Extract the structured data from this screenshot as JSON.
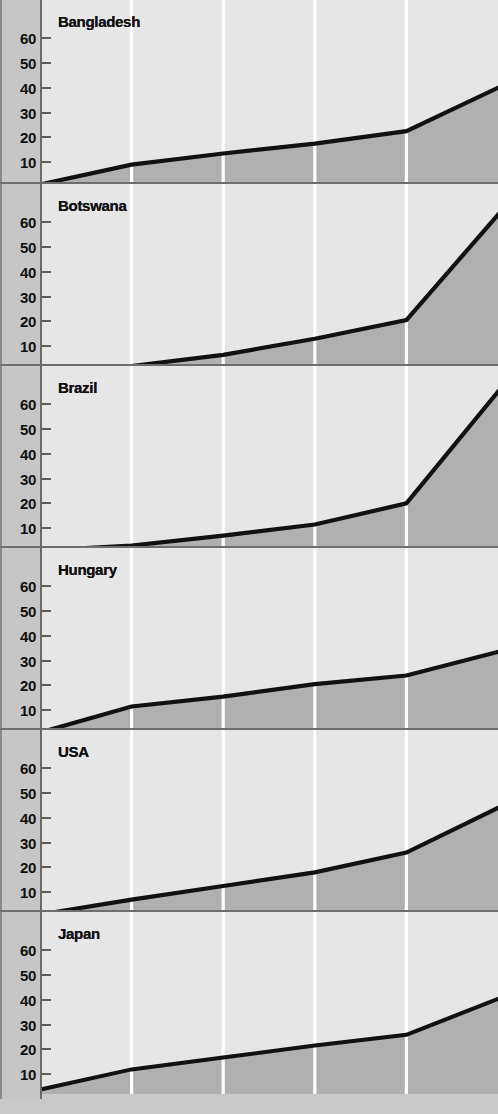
{
  "figure": {
    "kind": "small-multiples-area-chart",
    "panel_count": 6,
    "colors": {
      "gutter": "#c6c6c6",
      "area_above_line": "#e6e6e6",
      "area_below_line": "#b0b0b0",
      "line": "#111111",
      "gridline": "#ffffff",
      "axis": "#6a6a6a",
      "label_text": "#101010"
    }
  },
  "axis": {
    "y_ticks": [
      "60",
      "50",
      "40",
      "30",
      "20",
      "10"
    ],
    "y_tick_values": [
      60,
      50,
      40,
      30,
      20,
      10
    ],
    "y_min": 0,
    "y_max": 66,
    "gridline_count": 4
  },
  "chart_data": {
    "type": "area",
    "title": "",
    "subtitle": "",
    "xlabel": "",
    "ylabel": "",
    "ylim": [
      0,
      66
    ],
    "xlim": [
      0,
      5
    ],
    "grid": true,
    "legend": "none",
    "x": [
      0,
      1,
      2,
      3,
      4,
      5
    ],
    "gridline_x_positions": [
      1,
      2,
      3,
      4
    ],
    "panels": [
      {
        "label": "Bangladesh",
        "values": [
          1,
          9,
          13.5,
          17.5,
          22.5,
          40
        ],
        "ylim": [
          0,
          66
        ]
      },
      {
        "label": "Botswana",
        "values": [
          1,
          2,
          6.5,
          13,
          20.5,
          63
        ],
        "ylim": [
          0,
          66
        ]
      },
      {
        "label": "Brazil",
        "values": [
          1,
          3,
          7,
          11.5,
          20,
          65
        ],
        "ylim": [
          0,
          66
        ]
      },
      {
        "label": "Hungary",
        "values": [
          1,
          11.5,
          15.5,
          20.5,
          24,
          33.5
        ],
        "ylim": [
          0,
          66
        ]
      },
      {
        "label": "USA",
        "values": [
          1,
          7,
          12.5,
          18,
          26,
          44
        ],
        "ylim": [
          0,
          66
        ]
      },
      {
        "label": "Japan",
        "values": [
          1,
          9.5,
          14.5,
          19.5,
          24,
          39
        ],
        "ylim": [
          0,
          66
        ]
      }
    ]
  }
}
